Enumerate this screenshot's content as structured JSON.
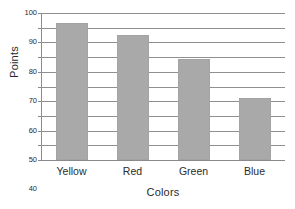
{
  "chart_data": {
    "type": "bar",
    "title": "",
    "subtitle": "",
    "categories": [
      "Yellow",
      "Red",
      "Green",
      "Blue"
    ],
    "values": [
      93,
      85,
      69,
      42
    ],
    "series": [
      {
        "name": "Points",
        "values": [
          93,
          85,
          69,
          42
        ]
      }
    ],
    "xlabel": "Colors",
    "ylabel": "Points",
    "ylim": [
      0,
      100
    ],
    "ytick_values": [
      0,
      10,
      20,
      30,
      40,
      50,
      60,
      70,
      80,
      90,
      100
    ],
    "ytick_labels": [
      "0",
      "10",
      "20",
      "30",
      "40",
      "50",
      "60",
      "70",
      "80",
      "90",
      "100"
    ],
    "grid": "horizontal",
    "legend": "none",
    "bar_color": "#a9a9a9",
    "grid_color": "#8f8f8f",
    "axis_color": "#8a8a8a",
    "background_color": "#ffffff",
    "text_color": "#2b2b2b",
    "annotations": []
  }
}
